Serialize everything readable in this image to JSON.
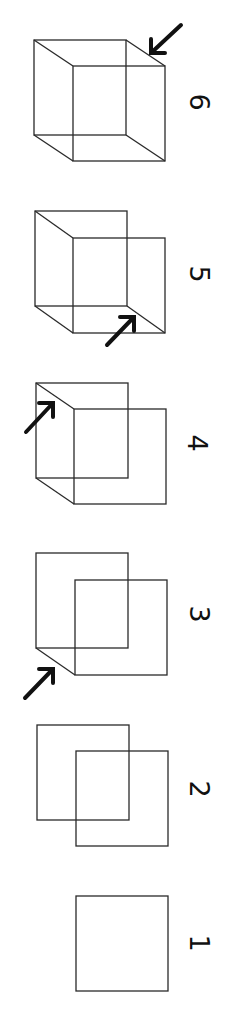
{
  "diagram": {
    "title": "",
    "orientation": "rotated-90-clockwise",
    "colors": {
      "background": "#ffffff",
      "line": "#2a2a2a",
      "arrow": "#111111"
    },
    "steps": [
      {
        "label": "1",
        "label_pos": [
          199,
          943
        ],
        "back_square": null,
        "front_square": {
          "x": 76,
          "y": 896,
          "w": 92,
          "h": 95
        },
        "connectors": [],
        "arrow": null
      },
      {
        "label": "2",
        "label_pos": [
          199,
          789
        ],
        "back_square": {
          "x": 37,
          "y": 725,
          "w": 92,
          "h": 95
        },
        "front_square": {
          "x": 76,
          "y": 751,
          "w": 92,
          "h": 95
        },
        "connectors": [],
        "arrow": null
      },
      {
        "label": "3",
        "label_pos": [
          199,
          614
        ],
        "back_square": {
          "x": 36,
          "y": 553,
          "w": 92,
          "h": 95
        },
        "front_square": {
          "x": 75,
          "y": 580,
          "w": 92,
          "h": 95
        },
        "connectors": [
          "bottom-left"
        ],
        "arrow": {
          "from": [
            25,
            698
          ],
          "to": [
            53,
            669
          ]
        }
      },
      {
        "label": "4",
        "label_pos": [
          197,
          443
        ],
        "back_square": {
          "x": 36,
          "y": 383,
          "w": 92,
          "h": 95
        },
        "front_square": {
          "x": 74,
          "y": 409,
          "w": 92,
          "h": 95
        },
        "connectors": [
          "bottom-left",
          "top-left"
        ],
        "arrow": {
          "from": [
            26,
            432
          ],
          "to": [
            53,
            403
          ]
        }
      },
      {
        "label": "5",
        "label_pos": [
          199,
          274
        ],
        "back_square": {
          "x": 35,
          "y": 211,
          "w": 92,
          "h": 95
        },
        "front_square": {
          "x": 73,
          "y": 238,
          "w": 92,
          "h": 95
        },
        "connectors": [
          "bottom-left",
          "top-left",
          "bottom-right"
        ],
        "arrow": {
          "from": [
            107,
            345
          ],
          "to": [
            134,
            317
          ]
        }
      },
      {
        "label": "6",
        "label_pos": [
          199,
          102
        ],
        "back_square": {
          "x": 34,
          "y": 40,
          "w": 92,
          "h": 95
        },
        "front_square": {
          "x": 73,
          "y": 66,
          "w": 92,
          "h": 95
        },
        "connectors": [
          "bottom-left",
          "top-left",
          "bottom-right",
          "top-right"
        ],
        "arrow": {
          "from": [
            181,
            25
          ],
          "to": [
            151,
            53
          ]
        }
      }
    ]
  }
}
